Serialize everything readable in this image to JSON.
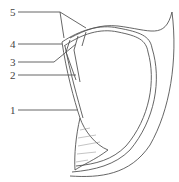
{
  "diagram": {
    "labels": [
      {
        "id": "5",
        "text": "5",
        "x": 10,
        "y": 8
      },
      {
        "id": "4",
        "text": "4",
        "x": 10,
        "y": 40
      },
      {
        "id": "3",
        "text": "3",
        "x": 10,
        "y": 58
      },
      {
        "id": "2",
        "text": "2",
        "x": 10,
        "y": 71
      },
      {
        "id": "1",
        "text": "1",
        "x": 10,
        "y": 106
      }
    ],
    "colors": {
      "stroke": "#555555",
      "hatch": "#888888"
    }
  }
}
